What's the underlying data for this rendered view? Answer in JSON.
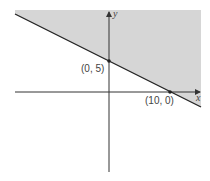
{
  "diagram": {
    "type": "linear-inequality-graph",
    "axes": {
      "x_label": "x",
      "y_label": "y"
    },
    "boundary_line": {
      "description": "line through (0, 5) and (10, 0)",
      "style": "solid"
    },
    "shaded_region": "above the line",
    "points": [
      {
        "label": "(0, 5)",
        "x": 0,
        "y": 5
      },
      {
        "label": "(10, 0)",
        "x": 10,
        "y": 0
      }
    ],
    "colors": {
      "shade": "#d6d6d6",
      "line": "#222222",
      "axes": "#333333",
      "text": "#444444"
    }
  }
}
